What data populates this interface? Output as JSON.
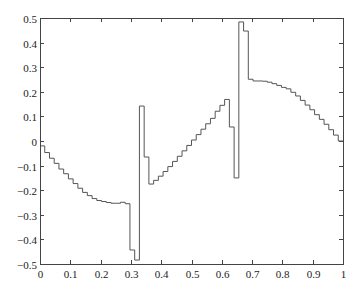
{
  "chart_data": {
    "type": "line",
    "style": "step",
    "title": "",
    "xlabel": "",
    "ylabel": "",
    "xlim": [
      0,
      1
    ],
    "ylim": [
      -0.5,
      0.5
    ],
    "grid": false,
    "legend": null,
    "box": true,
    "x_ticks": [
      0,
      0.1,
      0.2,
      0.3,
      0.4,
      0.5,
      0.6,
      0.7,
      0.8,
      0.9,
      1
    ],
    "x_tick_labels": [
      "0",
      "0.1",
      "0.2",
      "0.3",
      "0.4",
      "0.5",
      "0.6",
      "0.7",
      "0.8",
      "0.9",
      "1"
    ],
    "y_ticks": [
      -0.5,
      -0.4,
      -0.3,
      -0.2,
      -0.1,
      0,
      0.1,
      0.2,
      0.3,
      0.4,
      0.5
    ],
    "y_tick_labels": [
      "−0.5",
      "−0.4",
      "−0.3",
      "−0.2",
      "−0.1",
      "0",
      "0.1",
      "0.2",
      "0.3",
      "0.4",
      "0.5"
    ],
    "bin_count": 64,
    "bin_width": 0.015625,
    "series": [
      {
        "name": "piecewise-constant approximation",
        "color": "#555555",
        "x_edges_start": 0,
        "values": [
          -0.02,
          -0.047,
          -0.07,
          -0.091,
          -0.114,
          -0.133,
          -0.154,
          -0.173,
          -0.192,
          -0.209,
          -0.222,
          -0.234,
          -0.242,
          -0.246,
          -0.25,
          -0.253,
          -0.253,
          -0.249,
          -0.255,
          -0.443,
          -0.484,
          0.142,
          -0.065,
          -0.175,
          -0.16,
          -0.143,
          -0.124,
          -0.104,
          -0.083,
          -0.062,
          -0.04,
          -0.018,
          0.004,
          0.026,
          0.048,
          0.07,
          0.092,
          0.121,
          0.145,
          0.169,
          0.057,
          -0.15,
          0.484,
          0.447,
          0.251,
          0.244,
          0.244,
          0.243,
          0.239,
          0.233,
          0.226,
          0.218,
          0.212,
          0.198,
          0.183,
          0.165,
          0.146,
          0.127,
          0.107,
          0.088,
          0.068,
          0.046,
          0.024,
          0.0
        ]
      }
    ]
  },
  "layout": {
    "plot_left": 40,
    "plot_right": 343,
    "plot_top": 18,
    "plot_bottom": 264
  }
}
